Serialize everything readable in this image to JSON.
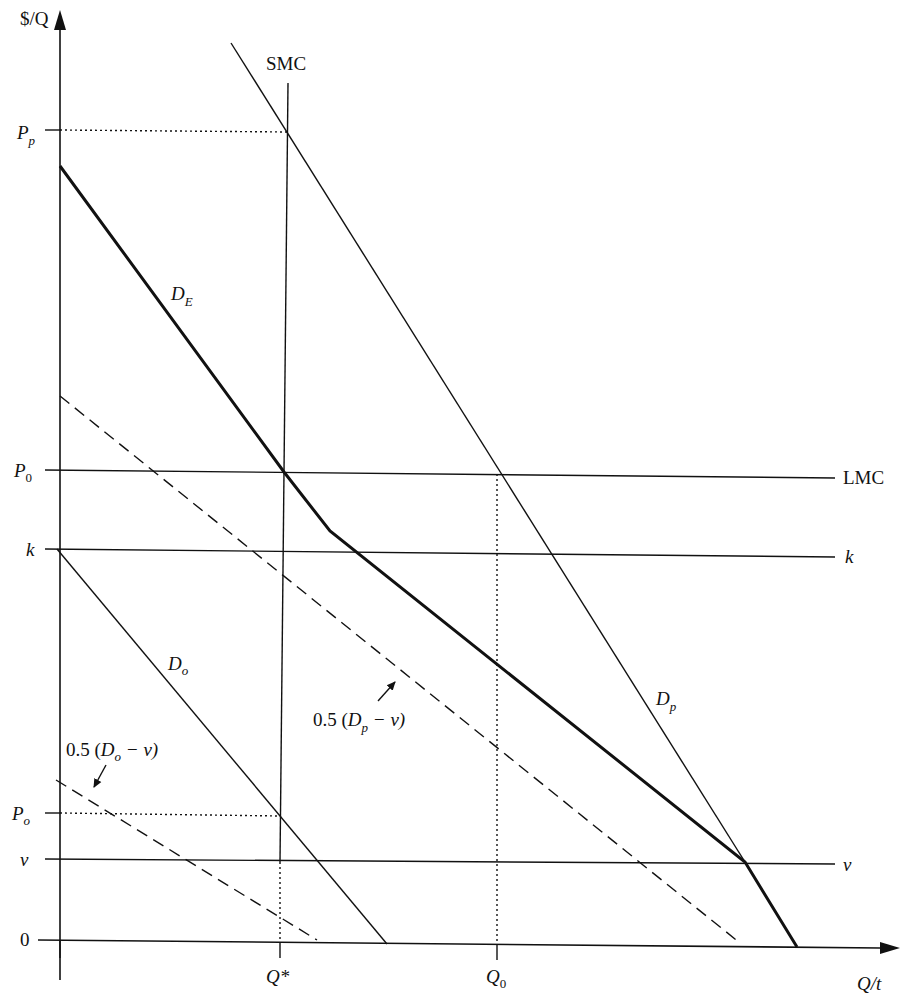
{
  "diagram": {
    "axes": {
      "y_label": "$/Q",
      "x_label": "Q/t"
    },
    "y_ticks": [
      {
        "key": "Pp",
        "main": "P",
        "sub": "p"
      },
      {
        "key": "P0",
        "main": "P",
        "sub": "0"
      },
      {
        "key": "k",
        "main": "k",
        "sub": ""
      },
      {
        "key": "Po",
        "main": "P",
        "sub": "o"
      },
      {
        "key": "v",
        "main": "v",
        "sub": ""
      },
      {
        "key": "zero",
        "main": "0",
        "sub": ""
      }
    ],
    "x_ticks": [
      {
        "key": "Qstar",
        "main": "Q*",
        "sub": ""
      },
      {
        "key": "Q0",
        "main": "Q",
        "sub": "0"
      }
    ],
    "curves": {
      "SMC": {
        "label": "SMC"
      },
      "LMC": {
        "label": "LMC"
      },
      "k_line": {
        "label": "k"
      },
      "v_line": {
        "label": "v"
      },
      "DE": {
        "main": "D",
        "sub": "E"
      },
      "Dp": {
        "main": "D",
        "sub": "p"
      },
      "Do": {
        "main": "D",
        "sub": "o"
      },
      "half_Dp": {
        "prefix": "0.5 (",
        "main": "D",
        "sub": "p",
        "suffix": " − v)"
      },
      "half_Do": {
        "prefix": "0.5 (",
        "main": "D",
        "sub": "o",
        "suffix": " − v)"
      }
    }
  }
}
